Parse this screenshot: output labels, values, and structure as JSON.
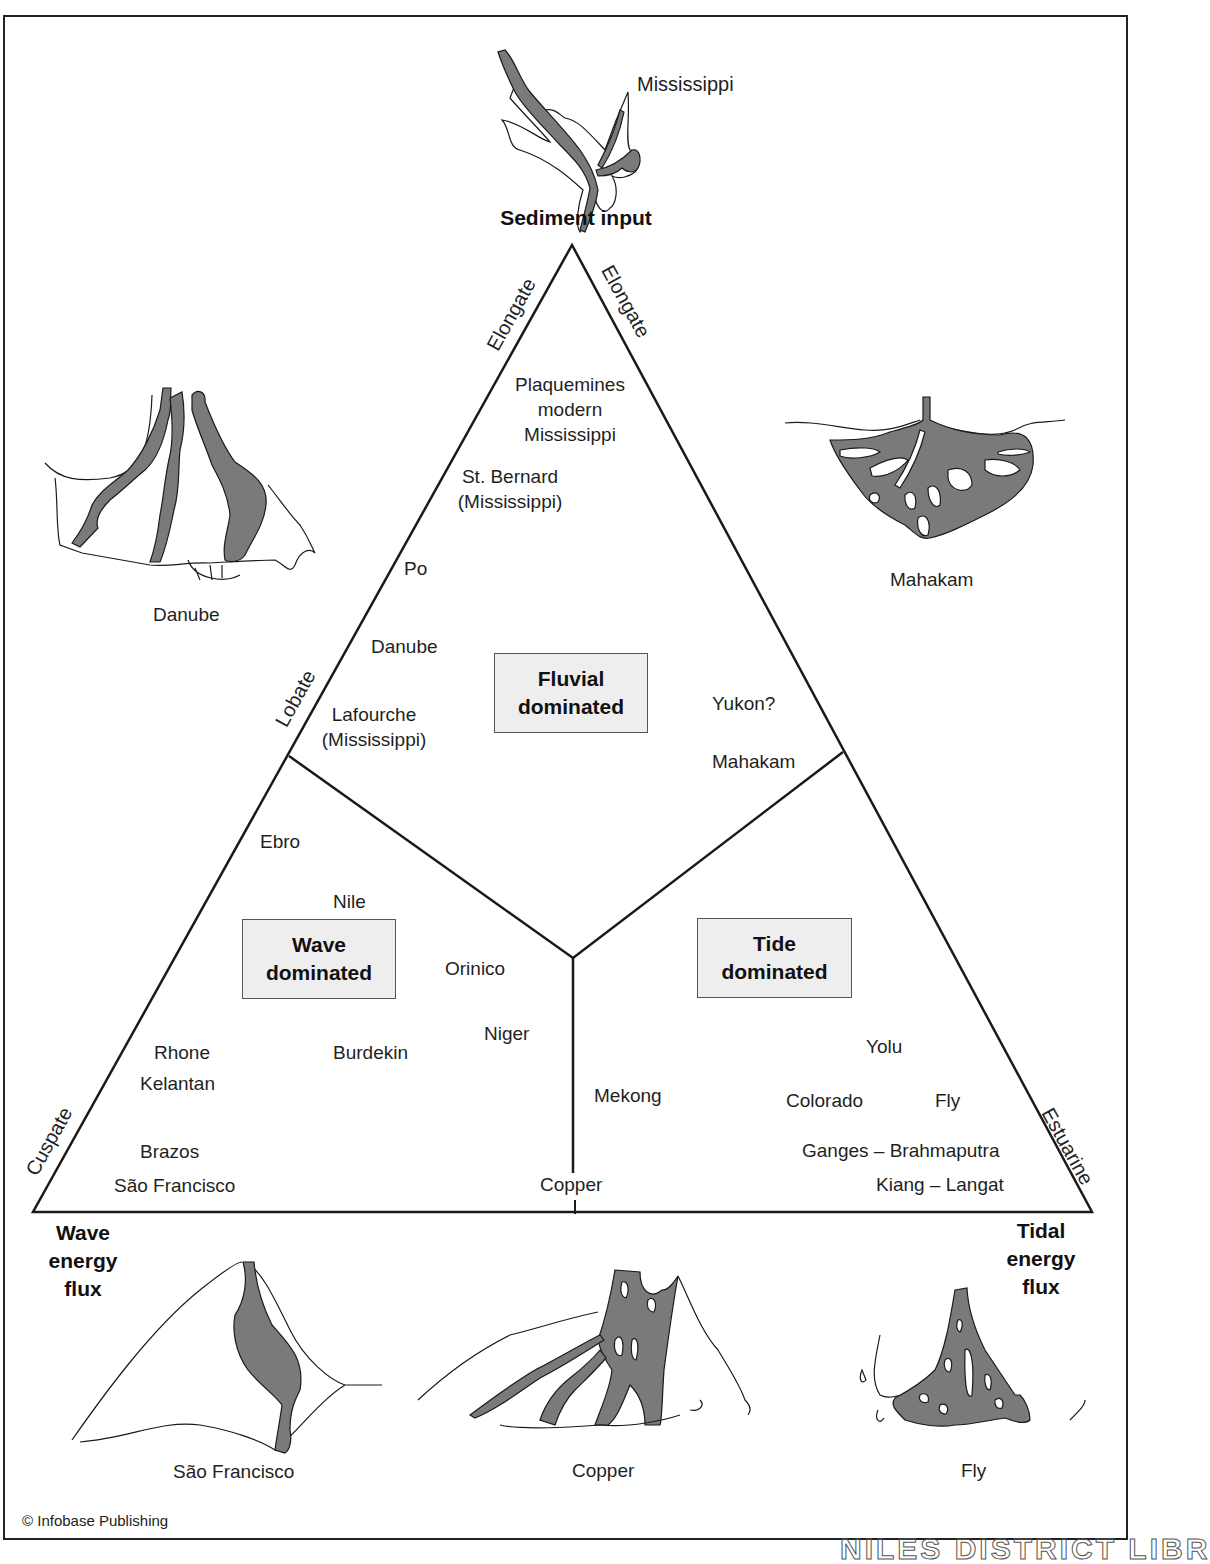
{
  "diagram": {
    "title_vertex_top": "Sediment input",
    "title_vertex_left": [
      "Wave",
      "energy",
      "flux"
    ],
    "title_vertex_right": [
      "Tidal",
      "energy",
      "flux"
    ],
    "edge_labels": {
      "left_upper": "Elongate",
      "right_upper": "Elongate",
      "left_middle": "Lobate",
      "left_lower": "Cuspate",
      "right_lower": "Estuarine"
    },
    "regions": {
      "fluvial": [
        "Fluvial",
        "dominated"
      ],
      "wave": [
        "Wave",
        "dominated"
      ],
      "tide": [
        "Tide",
        "dominated"
      ]
    },
    "deltas": {
      "fluvial": [
        {
          "name": "Plaquemines modern Mississippi",
          "lines": [
            "Plaquemines",
            "modern",
            "Mississippi"
          ]
        },
        {
          "name": "St. Bernard (Mississippi)",
          "lines": [
            "St. Bernard",
            "(Mississippi)"
          ]
        },
        {
          "name": "Po",
          "lines": [
            "Po"
          ]
        },
        {
          "name": "Danube",
          "lines": [
            "Danube"
          ]
        },
        {
          "name": "Lafourche (Mississippi)",
          "lines": [
            "Lafourche",
            "(Mississippi)"
          ]
        },
        {
          "name": "Yukon?",
          "lines": [
            "Yukon?"
          ]
        },
        {
          "name": "Mahakam",
          "lines": [
            "Mahakam"
          ]
        }
      ],
      "wave": [
        {
          "name": "Ebro"
        },
        {
          "name": "Nile"
        },
        {
          "name": "Orinico"
        },
        {
          "name": "Niger"
        },
        {
          "name": "Rhone"
        },
        {
          "name": "Kelantan"
        },
        {
          "name": "Burdekin"
        },
        {
          "name": "Brazos"
        },
        {
          "name": "São Francisco"
        }
      ],
      "tide": [
        {
          "name": "Yolu"
        },
        {
          "name": "Mekong"
        },
        {
          "name": "Colorado"
        },
        {
          "name": "Fly"
        },
        {
          "name": "Ganges – Brahmaputra"
        },
        {
          "name": "Kiang – Langat"
        }
      ],
      "boundary": [
        {
          "name": "Copper"
        }
      ]
    },
    "sketches": {
      "top": "Mississippi",
      "upper_left": "Danube",
      "upper_right": "Mahakam",
      "bottom_left": "São Francisco",
      "bottom_center": "Copper",
      "bottom_right": "Fly"
    },
    "credit": "© Infobase Publishing",
    "watermark": "NILES DISTRICT LIBR",
    "colors": {
      "channel_fill": "#7a7a7a",
      "region_box_fill": "#eeeeee",
      "line": "#1a1a1a"
    }
  }
}
